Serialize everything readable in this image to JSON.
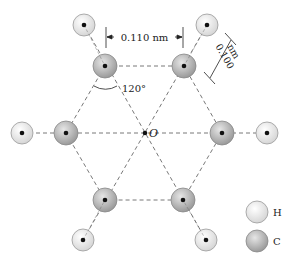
{
  "diagram": {
    "center_label": "O",
    "dimensions": {
      "cc_distance": "0.110 nm",
      "ch_distance_value": "0.100",
      "ch_distance_unit": "nm",
      "angle": "120°"
    },
    "legend": [
      {
        "label": "H",
        "atom": "hydrogen"
      },
      {
        "label": "C",
        "atom": "carbon"
      }
    ],
    "colors": {
      "hydrogen_fill": "#ececec",
      "carbon_fill": "#b8b8b8",
      "atom_stroke": "#8a8a8a",
      "bond_line": "#555555"
    }
  }
}
